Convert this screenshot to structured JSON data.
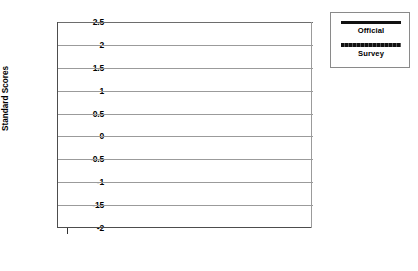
{
  "chart_data": {
    "type": "line",
    "title": "",
    "xlabel": "",
    "ylabel": "Standard Scores",
    "xlim": [
      1972.4,
      1987.6
    ],
    "ylim": [
      -2,
      2.5
    ],
    "grid": true,
    "legend_position": "right-outside",
    "y_ticks": [
      "2.5",
      "2",
      "1.5",
      "1",
      "0.5",
      "0",
      "-0.5",
      "-1",
      "-15",
      "-2"
    ],
    "y_tick_values": [
      2.5,
      2,
      1.5,
      1,
      0.5,
      0,
      -0.5,
      -1,
      -1.5,
      -2
    ],
    "x_ticks_major": [
      "1973",
      "1975",
      "1977",
      "1979",
      "1981",
      "1983",
      "1985",
      "1987"
    ],
    "x_tick_major_values": [
      1973,
      1975,
      1977,
      1979,
      1981,
      1983,
      1985,
      1987
    ],
    "x_tick_minor_values": [
      1974,
      1976,
      1978,
      1980,
      1982,
      1984,
      1986
    ],
    "series": [
      {
        "name": "Official",
        "color": "#111111",
        "x": [
          1973,
          1974,
          1975,
          1976,
          1977,
          1978,
          1979,
          1980,
          1981,
          1982,
          1983,
          1984,
          1985,
          1986,
          1987
        ],
        "values": [
          -1.75,
          -1.35,
          -1.18,
          -1.0,
          -0.82,
          -0.52,
          0.05,
          0.72,
          0.38,
          0.75,
          0.2,
          -1.5,
          -0.35,
          -1.6,
          -1.5
        ]
      },
      {
        "name": "Survey",
        "color": "#111111",
        "x": [
          1973,
          1974,
          1975,
          1976,
          1977,
          1978,
          1979,
          1980,
          1981,
          1982,
          1983,
          1984,
          1985,
          1986,
          1987
        ],
        "values": [
          1.05,
          1.4,
          0.47,
          0.72,
          0.8,
          0.88,
          0.7,
          0.58,
          0.78,
          0.52,
          0.37,
          0.55,
          0.78,
          1.35,
          2.0
        ]
      }
    ]
  },
  "legend": {
    "entries": [
      {
        "label": "Official",
        "style": "solid"
      },
      {
        "label": "Survey",
        "style": "textured"
      }
    ]
  }
}
